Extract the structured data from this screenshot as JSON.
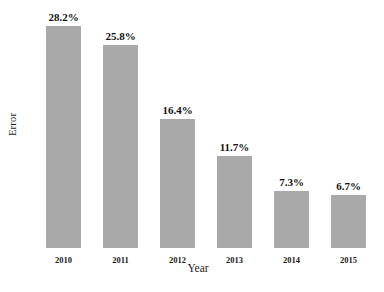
{
  "chart_data": {
    "type": "bar",
    "title": "",
    "xlabel": "Year",
    "ylabel": "Error",
    "categories": [
      "2010",
      "2011",
      "2012",
      "2013",
      "2014",
      "2015"
    ],
    "values": [
      28.2,
      25.8,
      16.4,
      11.7,
      7.3,
      6.7
    ],
    "value_labels": [
      "28.2%",
      "25.8%",
      "16.4%",
      "11.7%",
      "7.3%",
      "6.7%"
    ],
    "ylim": [
      0,
      30.5
    ],
    "grid": false,
    "legend": null,
    "legend_position": "none",
    "axis_lines": false,
    "bar_color": "#a9a9a9",
    "background_color": "#ffffff",
    "label_color": "#111111"
  },
  "axes": {
    "y_title": "Error",
    "x_title": "Year"
  }
}
